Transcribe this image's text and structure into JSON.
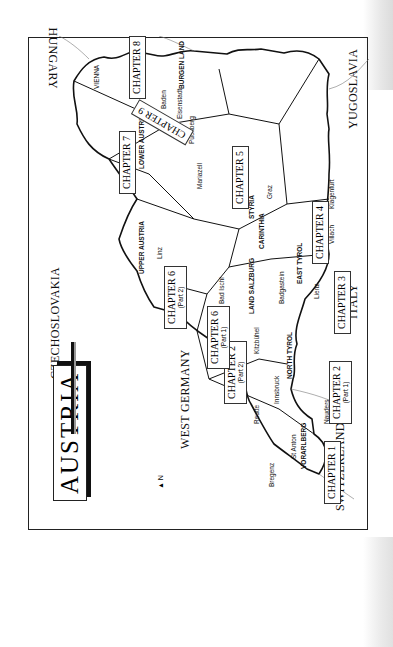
{
  "title": "AUSTRIA",
  "countries": [
    "CZECHOSLOVAKIA",
    "HUNGARY",
    "YUGOSLAVIA",
    "ITALY",
    "SWITZERLAND",
    "WEST GERMANY"
  ],
  "regions": [
    "LOWER AUSTRIA",
    "UPPER AUSTRIA",
    "BURGEN LAND",
    "STYRIA",
    "CARINTHIA",
    "LAND SALZBURG",
    "EAST TYROL",
    "NORTH TYROL",
    "VORARLBERG"
  ],
  "cities": [
    "VIENNA",
    "Baden",
    "Eisenstadt",
    "Puchberg",
    "Mariazell",
    "Graz",
    "Klagenfurt",
    "Villach",
    "Linz",
    "Bad Ischl",
    "Salzburg",
    "Badgastein",
    "Lienz",
    "Kitzbühel",
    "Innsbruck",
    "Reutte",
    "Nauders",
    "St Anton",
    "Bregenz"
  ],
  "chapters": [
    {
      "label": "CHAPTER 1",
      "part": ""
    },
    {
      "label": "CHAPTER 2",
      "part": "(Part 1)"
    },
    {
      "label": "CHAPTER 2",
      "part": "(Part 2)"
    },
    {
      "label": "CHAPTER 3",
      "part": ""
    },
    {
      "label": "CHAPTER 4",
      "part": ""
    },
    {
      "label": "CHAPTER 5",
      "part": ""
    },
    {
      "label": "CHAPTER 6",
      "part": "(Part 1)"
    },
    {
      "label": "CHAPTER 6",
      "part": "(Part 2)"
    },
    {
      "label": "CHAPTER 7",
      "part": ""
    },
    {
      "label": "CHAPTER 8",
      "part": ""
    },
    {
      "label": "CHAPTER 9",
      "part": ""
    }
  ],
  "scale": {
    "km_ticks": [
      "0",
      "20",
      "40",
      "60",
      "80",
      "100km"
    ],
    "mile_ticks": [
      "0",
      "20",
      "10",
      "30",
      "40",
      "50",
      "60 Miles"
    ]
  },
  "north_label": "N"
}
